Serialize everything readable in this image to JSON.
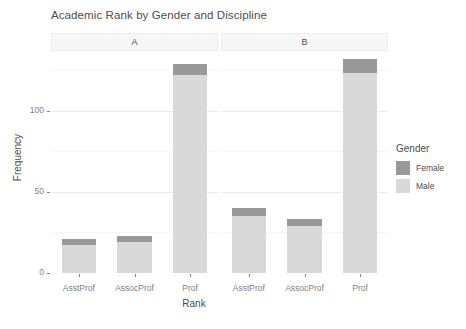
{
  "chart_data": {
    "type": "bar",
    "subtype": "stacked-bar-faceted",
    "title": "Academic Rank by Gender and Discipline",
    "xlabel": "Rank",
    "ylabel": "Frequency",
    "categories": [
      "AsstProf",
      "AssocProf",
      "Prof"
    ],
    "facet_variable": "Discipline",
    "facets": [
      {
        "label": "A",
        "categories": [
          "AsstProf",
          "AssocProf",
          "Prof"
        ],
        "series": [
          {
            "name": "Male",
            "values": [
              17,
              19,
              122
            ]
          },
          {
            "name": "Female",
            "values": [
              4,
              4,
              7
            ]
          }
        ],
        "totals": [
          21,
          23,
          129
        ]
      },
      {
        "label": "B",
        "categories": [
          "AsstProf",
          "AssocProf",
          "Prof"
        ],
        "series": [
          {
            "name": "Male",
            "values": [
              35,
              29,
              123
            ]
          },
          {
            "name": "Female",
            "values": [
              5,
              4,
              9
            ]
          }
        ],
        "totals": [
          40,
          33,
          132
        ]
      }
    ],
    "legend": {
      "title": "Gender",
      "position": "right",
      "entries": [
        {
          "label": "Female",
          "color": "#999999"
        },
        {
          "label": "Male",
          "color": "#d9d9d9"
        }
      ]
    },
    "yticks": [
      0,
      50,
      100
    ],
    "ytick_labels": [
      "0",
      "50",
      "100"
    ],
    "ylim": [
      0,
      135
    ],
    "grid": true,
    "stack_order": [
      "Male",
      "Female"
    ]
  },
  "colors": {
    "female": "#999999",
    "male": "#d9d9d9",
    "gridline_major": "#ebebeb",
    "gridline_minor": "#f5f5f5",
    "strip_background": "#f7f7f7",
    "text": "#4d4d4d",
    "axis_text": "#7f7f7f",
    "panel_background": "#ffffff"
  }
}
